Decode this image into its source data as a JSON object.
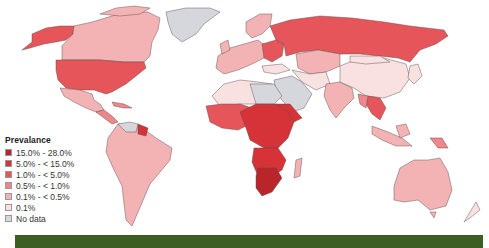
{
  "legend": {
    "title": "Prevalance",
    "items": [
      {
        "label": "15.0% - 28.0%",
        "color": "#b8262b"
      },
      {
        "label": "5.0% - < 15.0%",
        "color": "#d53338"
      },
      {
        "label": "1.0% - < 5.0%",
        "color": "#e6555a"
      },
      {
        "label": "0.5% - < 1.0%",
        "color": "#ef868a"
      },
      {
        "label": "0.1% - < 0.5%",
        "color": "#f3b3b4"
      },
      {
        "label": "0.1%",
        "color": "#f9e0e1"
      },
      {
        "label": "No data",
        "color": "#d6d7dc"
      }
    ]
  },
  "colors": {
    "band": "#3d5e22",
    "background": "#ffffff",
    "border": "#5a4a4a"
  }
}
